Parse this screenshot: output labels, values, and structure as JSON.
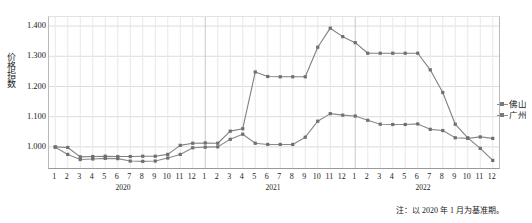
{
  "chart_data": {
    "type": "line",
    "title": "",
    "xlabel": "",
    "ylabel": "价格指数",
    "ylim": [
      0.93,
      1.43
    ],
    "yticks": [
      1.0,
      1.1,
      1.2,
      1.3,
      1.4
    ],
    "ytick_labels": [
      "1.000",
      "1.100",
      "1.200",
      "1.300",
      "1.400"
    ],
    "grid": true,
    "legend_position": "right",
    "note": "注：以 2020 年 1 月为基准期。",
    "x": [
      "1",
      "2",
      "3",
      "4",
      "5",
      "6",
      "7",
      "8",
      "9",
      "10",
      "11",
      "12",
      "1",
      "2",
      "3",
      "4",
      "5",
      "6",
      "7",
      "8",
      "9",
      "10",
      "11",
      "12",
      "1",
      "2",
      "3",
      "4",
      "5",
      "6",
      "7",
      "8",
      "9",
      "10",
      "11",
      "12"
    ],
    "year_groups": [
      {
        "label": "2020",
        "start_index": 0,
        "end_index": 11
      },
      {
        "label": "2021",
        "start_index": 12,
        "end_index": 23
      },
      {
        "label": "2022",
        "start_index": 24,
        "end_index": 35
      }
    ],
    "series": [
      {
        "name": "佛山",
        "color": "#808080",
        "values": [
          1.0,
          0.998,
          0.967,
          0.968,
          0.969,
          0.968,
          0.968,
          0.969,
          0.969,
          0.975,
          1.005,
          1.012,
          1.013,
          1.012,
          1.052,
          1.06,
          1.248,
          1.233,
          1.232,
          1.232,
          1.232,
          1.33,
          1.393,
          1.365,
          1.345,
          1.31,
          1.31,
          1.31,
          1.31,
          1.31,
          1.255,
          1.18,
          1.075,
          1.03,
          0.995,
          0.955
        ]
      },
      {
        "name": "广州",
        "color": "#8a8a8a",
        "values": [
          0.999,
          0.975,
          0.958,
          0.96,
          0.962,
          0.961,
          0.953,
          0.952,
          0.953,
          0.963,
          0.975,
          0.997,
          0.999,
          1.0,
          1.025,
          1.042,
          1.012,
          1.008,
          1.008,
          1.008,
          1.032,
          1.085,
          1.11,
          1.105,
          1.102,
          1.088,
          1.075,
          1.074,
          1.074,
          1.076,
          1.058,
          1.054,
          1.03,
          1.028,
          1.033,
          1.028
        ]
      }
    ]
  },
  "axis": {
    "y_title": "价格指数"
  },
  "legend": {
    "items": [
      {
        "label": "佛山"
      },
      {
        "label": "广州"
      }
    ]
  },
  "footer": {
    "note": "注：以 2020 年 1 月为基准期。"
  }
}
